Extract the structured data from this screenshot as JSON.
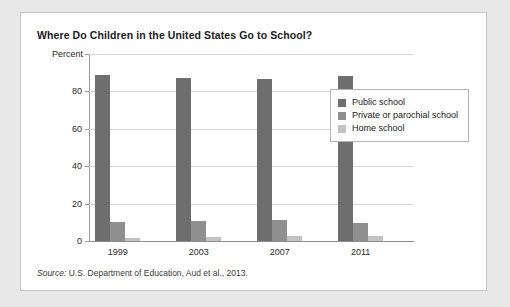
{
  "chart_data": {
    "type": "bar",
    "title": "Where Do Children in the United States Go to School?",
    "xlabel": "",
    "ylabel": "Percent",
    "ylim": [
      0,
      100
    ],
    "yticks": [
      0,
      20,
      40,
      60,
      80,
      100
    ],
    "grid": true,
    "legend_position": "inside-top-right",
    "categories": [
      "1999",
      "2003",
      "2007",
      "2011"
    ],
    "series": [
      {
        "name": "Public school",
        "color": "#6e6e6e",
        "values": [
          88.8,
          87.0,
          86.5,
          88.1
        ]
      },
      {
        "name": "Private or parochial school",
        "color": "#8f8f8f",
        "values": [
          10.2,
          10.8,
          11.1,
          9.6
        ]
      },
      {
        "name": "Home school",
        "color": "#c2c2c2",
        "values": [
          1.7,
          2.2,
          2.9,
          2.8
        ]
      }
    ],
    "source": {
      "prefix": "Source:",
      "text": "U.S. Department of Education, Aud et al., 2013."
    }
  },
  "figure": {
    "title": "Where Do Children in the United States Go to School?",
    "y_axis_label": "Percent",
    "y_tick_labels": [
      "100",
      "80",
      "60",
      "40",
      "20",
      "0"
    ],
    "x_tick_labels": [
      "1999",
      "2003",
      "2007",
      "2011"
    ],
    "legend": [
      {
        "label": "Public school",
        "color": "#6e6e6e"
      },
      {
        "label": "Private or parochial school",
        "color": "#8f8f8f"
      },
      {
        "label": "Home school",
        "color": "#c2c2c2"
      }
    ],
    "source_prefix": "Source:",
    "source_text": "U.S. Department of Education, Aud et al., 2013.",
    "colors": {
      "page_background": "#e8e8e8",
      "card_background": "#ffffff",
      "card_border": "#c6c6c6",
      "gridline": "#d6d6d6",
      "axis": "#8c8c8c",
      "text": "#2a2a2a",
      "title_text": "#1b1b1b"
    }
  }
}
